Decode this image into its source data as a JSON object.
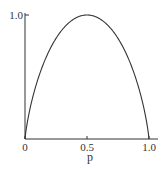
{
  "chart_data": {
    "type": "line",
    "title": "",
    "xlabel": "p",
    "ylabel": "",
    "xlim": [
      0,
      1.0
    ],
    "ylim": [
      0,
      1.0
    ],
    "grid": false,
    "legend": null,
    "x_ticks": [
      {
        "value": 0,
        "label": "0"
      },
      {
        "value": 0.5,
        "label": "0.5"
      },
      {
        "value": 1.0,
        "label": "1.0"
      }
    ],
    "y_ticks": [
      {
        "value": 1.0,
        "label": "1.0"
      }
    ],
    "series": [
      {
        "name": "H(p)",
        "x": [
          0,
          0.02,
          0.05,
          0.1,
          0.15,
          0.2,
          0.25,
          0.3,
          0.35,
          0.4,
          0.45,
          0.5,
          0.55,
          0.6,
          0.65,
          0.7,
          0.75,
          0.8,
          0.85,
          0.9,
          0.95,
          0.98,
          1.0
        ],
        "values": [
          0,
          0.141,
          0.286,
          0.469,
          0.61,
          0.722,
          0.811,
          0.881,
          0.934,
          0.971,
          0.993,
          1.0,
          0.993,
          0.971,
          0.934,
          0.881,
          0.811,
          0.722,
          0.61,
          0.469,
          0.286,
          0.141,
          0
        ]
      }
    ],
    "colors": {
      "line": "#333333",
      "axis": "#333333"
    }
  }
}
